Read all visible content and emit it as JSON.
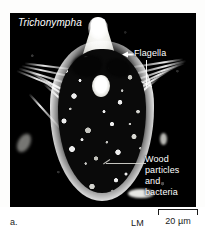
{
  "figure": {
    "panel_letter": "a.",
    "organism_name": "Trichonympha",
    "microscopy_type": "LM",
    "background_color": "#ffffff",
    "plate_color": "#000000",
    "annotation_color": "#ffffff"
  },
  "annotations": {
    "flagella": {
      "label": "Flagella",
      "pointer": "arrow-left"
    },
    "wood": {
      "line1": "Wood",
      "line2": "particles",
      "line3": "and",
      "line4": "bacteria",
      "pointer": "leader-line"
    }
  },
  "scale": {
    "value": "20 µm",
    "microscopy_label": "LM"
  }
}
